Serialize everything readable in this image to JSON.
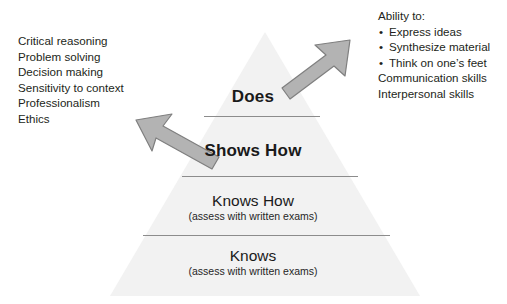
{
  "diagram": {
    "background_color": "#ffffff",
    "pyramid_fill": "#f2f2f2",
    "arrow_fill": "#b3b3b3",
    "arrow_stroke": "#808080",
    "divider_color": "#8c8c8c"
  },
  "tiers": [
    {
      "title": "Does",
      "subtitle": ""
    },
    {
      "title": "Shows How",
      "subtitle": ""
    },
    {
      "title": "Knows How",
      "subtitle": "(assess with written exams)"
    },
    {
      "title": "Knows",
      "subtitle": "(assess with written exams)"
    }
  ],
  "left_text": {
    "lines": [
      "Critical reasoning",
      "Problem solving",
      "Decision making",
      "Sensitivity to context",
      "Professionalism",
      "Ethics"
    ]
  },
  "right_text": {
    "heading": "Ability to:",
    "bullets": [
      "Express ideas",
      "Synthesize material",
      "Think on one’s feet"
    ],
    "bullet_glyph": "•",
    "trailing_lines": [
      "Communication skills",
      "Interpersonal skills"
    ]
  },
  "arrows": [
    {
      "name": "arrow-to-left-text",
      "direction": "up-left"
    },
    {
      "name": "arrow-to-right-text",
      "direction": "up-right"
    }
  ]
}
